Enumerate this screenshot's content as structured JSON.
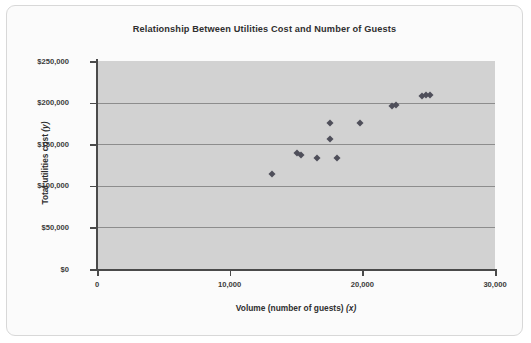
{
  "chart_data": {
    "type": "scatter",
    "title": "Relationship Between Utilities Cost and Number of Guests",
    "xlabel": "Volume (number of guests) (x)",
    "xlabel_main": "Volume (number of guests)",
    "xlabel_var": "(x)",
    "ylabel": "Total utilities cost (y)",
    "ylabel_main": "Total utilities cost",
    "ylabel_var": "(y)",
    "xlim": [
      0,
      30000
    ],
    "ylim": [
      0,
      250000
    ],
    "xticks": [
      0,
      10000,
      20000,
      30000
    ],
    "xtick_labels": [
      "0",
      "10,000",
      "20,000",
      "30,000"
    ],
    "yticks": [
      0,
      50000,
      100000,
      150000,
      200000,
      250000
    ],
    "ytick_labels": [
      "$0",
      "$50,000",
      "$100,000",
      "$150,000",
      "$200,000",
      "$250,000"
    ],
    "grid": "horizontal",
    "legend": "none",
    "marker_shape": "diamond",
    "marker_color": "#4f4f5a",
    "plot_background": "#d2d2d2",
    "gridline_color": "#8d8d8d",
    "points": [
      {
        "x": 13200,
        "y": 114000
      },
      {
        "x": 15100,
        "y": 140000
      },
      {
        "x": 15350,
        "y": 137000
      },
      {
        "x": 16600,
        "y": 133000
      },
      {
        "x": 17600,
        "y": 156000
      },
      {
        "x": 17600,
        "y": 175000
      },
      {
        "x": 18100,
        "y": 133000
      },
      {
        "x": 19800,
        "y": 176000
      },
      {
        "x": 22200,
        "y": 196000
      },
      {
        "x": 22500,
        "y": 197000
      },
      {
        "x": 24500,
        "y": 208000
      },
      {
        "x": 24800,
        "y": 209000
      },
      {
        "x": 25100,
        "y": 209000
      }
    ]
  }
}
